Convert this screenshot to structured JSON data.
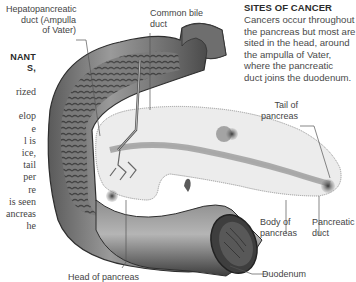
{
  "left_column": {
    "heading_lines": [
      "NANT",
      "S,"
    ],
    "body_lines": [
      "rized",
      "",
      "elop",
      "e",
      "l is",
      "ice,",
      "tail",
      "per",
      "re",
      "is seen",
      "ancreas",
      "he"
    ]
  },
  "sidebar": {
    "title": "SITES OF CANCER",
    "body_lines": [
      "Cancers occur throughout",
      "the pancreas but most are",
      "sited in the head, around",
      "the ampulla of Vater,",
      "where the pancreatic",
      "duct joins the duodenum."
    ]
  },
  "labels": {
    "hepatopancreatic": [
      "Hepatopancreatic",
      "duct (Ampulla",
      "of Vater)"
    ],
    "common_bile_duct": [
      "Common bile",
      "duct"
    ],
    "tail": [
      "Tail of",
      "pancreas"
    ],
    "body": [
      "Body of",
      "pancreas"
    ],
    "pancreatic_duct": [
      "Pancreatic",
      "duct"
    ],
    "head": [
      "Head of pancreas"
    ],
    "duodenum": [
      "Duodenum"
    ]
  },
  "colors": {
    "text": "#444444",
    "duodenum_dark": "#3c3c3c",
    "duodenum_mid": "#8a8a8a",
    "pancreas_fill": "#ececec",
    "tumor": "#555555",
    "leader_line": "#555555"
  }
}
